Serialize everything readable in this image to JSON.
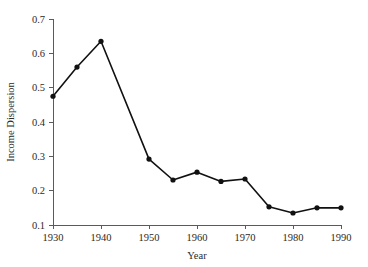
{
  "chart_data": {
    "type": "line",
    "title": "",
    "xlabel": "Year",
    "ylabel": "Income Dispersion",
    "xlim": [
      1930,
      1990
    ],
    "ylim": [
      0.1,
      0.7
    ],
    "grid": false,
    "legend": "none",
    "x": [
      1930,
      1935,
      1940,
      1950,
      1955,
      1960,
      1965,
      1970,
      1975,
      1980,
      1985,
      1990
    ],
    "values": [
      0.475,
      0.56,
      0.635,
      0.292,
      0.231,
      0.254,
      0.227,
      0.234,
      0.153,
      0.135,
      0.15,
      0.15
    ],
    "series": [
      {
        "name": "Income Dispersion",
        "marker": "filled-circle",
        "color": "#111111",
        "points": [
          {
            "x": 1930,
            "y": 0.475
          },
          {
            "x": 1935,
            "y": 0.56
          },
          {
            "x": 1940,
            "y": 0.635
          },
          {
            "x": 1950,
            "y": 0.292
          },
          {
            "x": 1955,
            "y": 0.231
          },
          {
            "x": 1960,
            "y": 0.254
          },
          {
            "x": 1965,
            "y": 0.227
          },
          {
            "x": 1970,
            "y": 0.234
          },
          {
            "x": 1975,
            "y": 0.153
          },
          {
            "x": 1980,
            "y": 0.135
          },
          {
            "x": 1985,
            "y": 0.15
          },
          {
            "x": 1990,
            "y": 0.15
          }
        ]
      }
    ],
    "xticks": [
      1930,
      1940,
      1950,
      1960,
      1970,
      1980,
      1990
    ],
    "xtick_labels": [
      "1930",
      "1940",
      "1950",
      "1960",
      "1970",
      "1980",
      "1990"
    ],
    "yticks": [
      0.1,
      0.2,
      0.3,
      0.4,
      0.5,
      0.6,
      0.7
    ],
    "ytick_labels": [
      "0.1",
      "0.2",
      "0.3",
      "0.4",
      "0.5",
      "0.6",
      "0.7"
    ]
  },
  "axis": {
    "x_title": "Year",
    "y_title": "Income Dispersion"
  }
}
